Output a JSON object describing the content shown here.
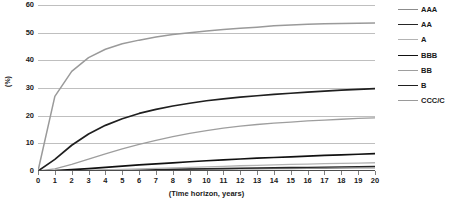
{
  "chart_data": {
    "type": "line",
    "title": "",
    "xlabel": "(Time horizon, years)",
    "ylabel": "(%)",
    "xlim": [
      0,
      20
    ],
    "ylim": [
      0,
      60
    ],
    "ytick_step": 10,
    "xtick_step": 1,
    "grid": true,
    "legend_position": "right",
    "x": [
      0,
      1,
      2,
      3,
      4,
      5,
      6,
      7,
      8,
      9,
      10,
      11,
      12,
      13,
      14,
      15,
      16,
      17,
      18,
      19,
      20
    ],
    "y_ticks": [
      60,
      50,
      40,
      30,
      20,
      10,
      0
    ],
    "x_ticks": [
      0,
      1,
      2,
      3,
      4,
      5,
      6,
      7,
      8,
      9,
      10,
      11,
      12,
      13,
      14,
      15,
      16,
      17,
      18,
      19,
      20
    ],
    "series": [
      {
        "name": "AAA",
        "color": "#8c8c8c",
        "width": 1.3,
        "values": [
          0,
          0.0,
          0.03,
          0.13,
          0.24,
          0.35,
          0.46,
          0.51,
          0.59,
          0.64,
          0.7,
          0.73,
          0.76,
          0.79,
          0.84,
          0.9,
          0.95,
          1.0,
          1.05,
          1.1,
          1.14
        ]
      },
      {
        "name": "AA",
        "color": "#262626",
        "width": 1.3,
        "values": [
          0,
          0.02,
          0.06,
          0.12,
          0.21,
          0.31,
          0.42,
          0.53,
          0.63,
          0.72,
          0.81,
          0.9,
          0.99,
          1.08,
          1.17,
          1.26,
          1.34,
          1.42,
          1.5,
          1.58,
          1.66
        ]
      },
      {
        "name": "A",
        "color": "#b3b3b3",
        "width": 1.3,
        "values": [
          0,
          0.06,
          0.15,
          0.26,
          0.4,
          0.55,
          0.72,
          0.92,
          1.11,
          1.31,
          1.51,
          1.7,
          1.89,
          2.06,
          2.21,
          2.36,
          2.5,
          2.63,
          2.75,
          2.87,
          2.98
        ]
      },
      {
        "name": "BBB",
        "color": "#111111",
        "width": 1.7,
        "values": [
          0,
          0.18,
          0.5,
          0.87,
          1.3,
          1.75,
          2.19,
          2.58,
          2.97,
          3.34,
          3.7,
          4.04,
          4.34,
          4.62,
          4.88,
          5.14,
          5.4,
          5.64,
          5.86,
          6.06,
          6.25
        ]
      },
      {
        "name": "BB",
        "color": "#9e9e9e",
        "width": 1.3,
        "values": [
          0,
          0.8,
          2.4,
          4.3,
          6.2,
          8.0,
          9.6,
          11.1,
          12.4,
          13.6,
          14.6,
          15.5,
          16.2,
          16.8,
          17.3,
          17.7,
          18.1,
          18.4,
          18.7,
          19.0,
          19.2
        ]
      },
      {
        "name": "B",
        "color": "#1f1f1f",
        "width": 1.7,
        "values": [
          0,
          4.2,
          9.3,
          13.4,
          16.5,
          18.9,
          20.8,
          22.3,
          23.5,
          24.5,
          25.4,
          26.1,
          26.7,
          27.2,
          27.7,
          28.1,
          28.5,
          28.9,
          29.2,
          29.5,
          29.8
        ]
      },
      {
        "name": "CCC/C",
        "color": "#9a9a9a",
        "width": 1.5,
        "values": [
          0,
          27.0,
          36.0,
          41.0,
          44.0,
          46.0,
          47.3,
          48.4,
          49.3,
          50.0,
          50.6,
          51.1,
          51.6,
          52.0,
          52.5,
          52.8,
          53.0,
          53.2,
          53.3,
          53.4,
          53.5
        ]
      }
    ]
  }
}
